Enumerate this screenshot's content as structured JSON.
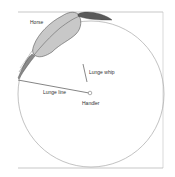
{
  "diagram": {
    "labels": {
      "horse": "Horse",
      "lunge_whip": "Lunge whip",
      "lunge_line": "Lunge line",
      "handler": "Handler"
    },
    "colors": {
      "background": "#ffffff",
      "frame": "#b0b0b0",
      "circle": "#a8a8a8",
      "horse_body": "#c8c8c8",
      "horse_outline": "#555555",
      "horse_dark": "#5a5a5a",
      "line": "#666666",
      "text": "#333333"
    }
  }
}
